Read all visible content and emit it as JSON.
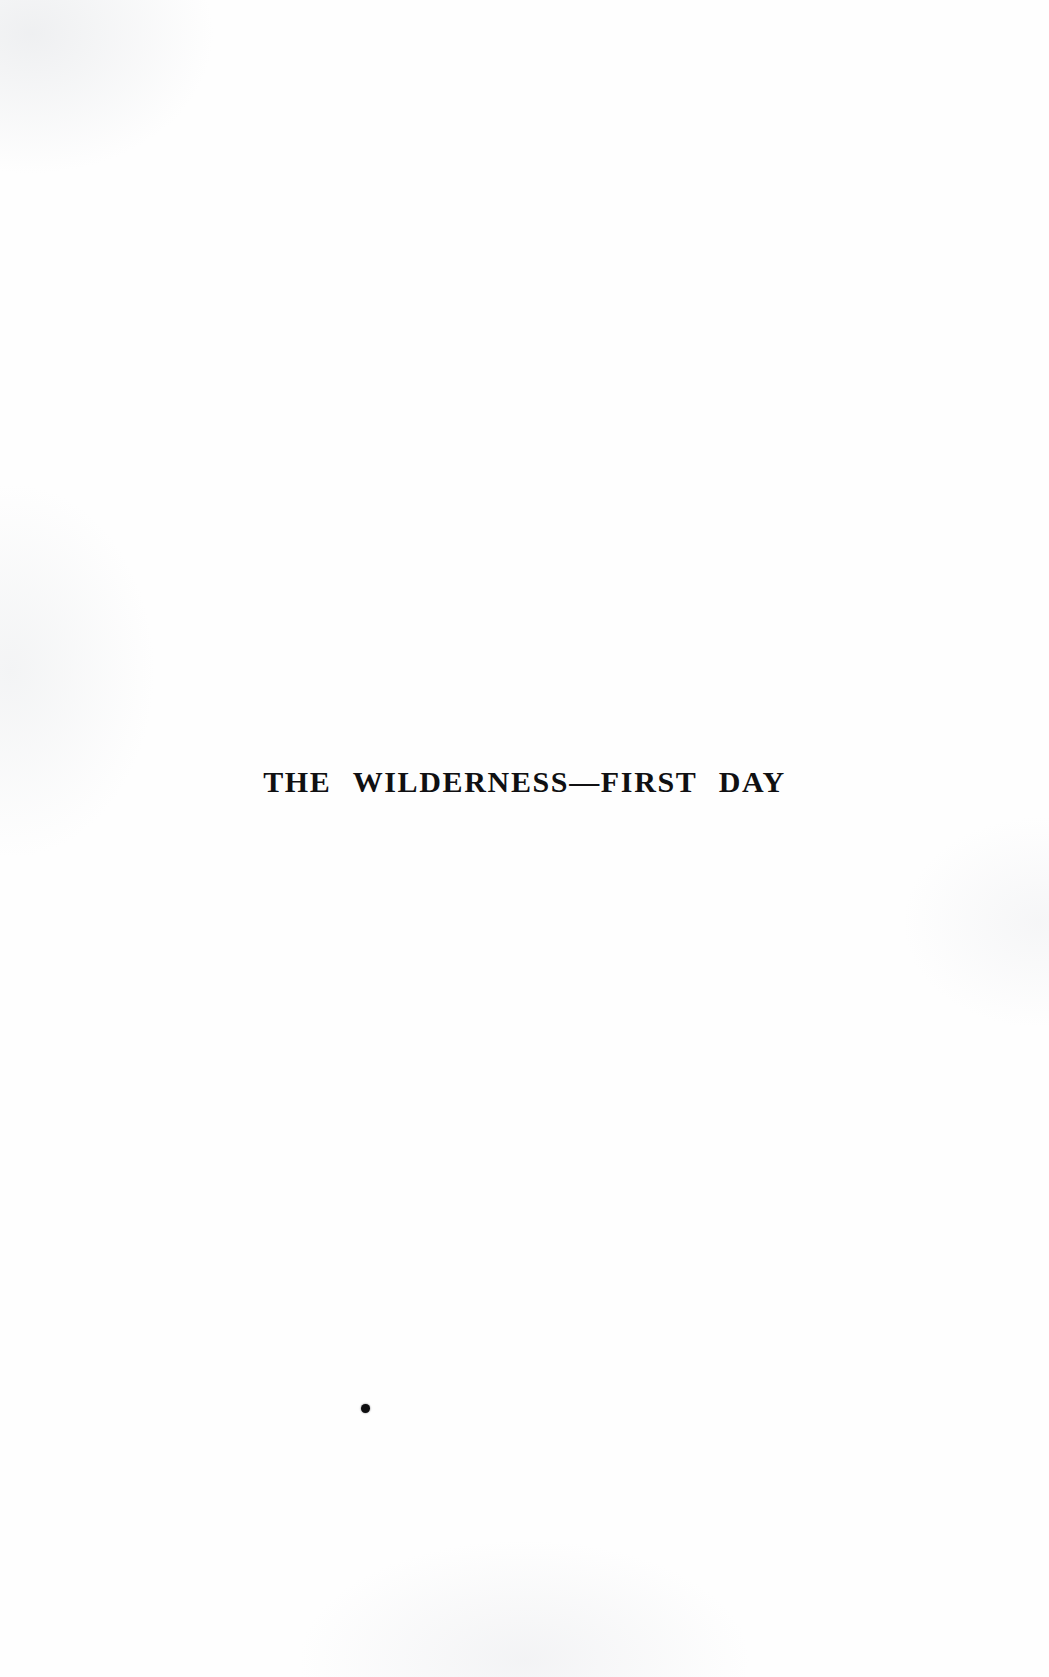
{
  "page": {
    "kind": "scanned-book-page",
    "background_color": "#fefefe",
    "ink_color": "#101012",
    "width_px": 1049,
    "height_px": 1677
  },
  "content": {
    "chapter_title": "THE WILDERNESS—FIRST DAY"
  },
  "marks": {
    "ink_speck": {
      "name": "ink-speck",
      "color": "#0d0d0f",
      "x_px": 365,
      "y_px": 1408,
      "diameter_px": 9
    }
  }
}
